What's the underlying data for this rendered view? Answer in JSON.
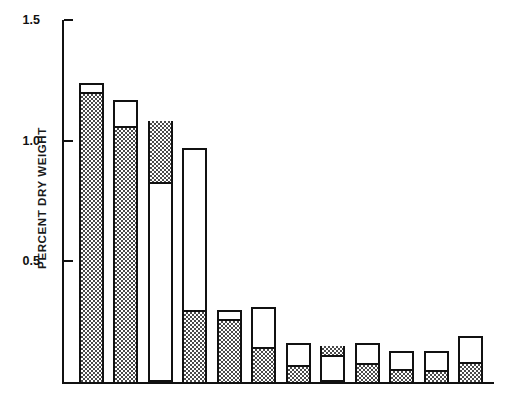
{
  "chart_data": {
    "type": "bar",
    "title": "",
    "subtitle": "",
    "xlabel": "",
    "ylabel": "PERCENT DRY WEIGHT",
    "ylim": [
      0,
      1.5
    ],
    "yticks": [
      0.5,
      1.0,
      1.5
    ],
    "ytick_labels": [
      "0.5",
      "1.0",
      "1.5"
    ],
    "grid": false,
    "legend": null,
    "stacked": true,
    "categories": [
      "N",
      "Ca",
      "K",
      "Si",
      "Mg",
      "S",
      "Al",
      "P",
      "Cl",
      "Fe",
      "Mn",
      "Na"
    ],
    "values": [
      1.24,
      1.17,
      1.08,
      0.97,
      0.3,
      0.31,
      0.16,
      0.15,
      0.16,
      0.13,
      0.13,
      0.19
    ],
    "series": [
      {
        "name": "shaded",
        "fill": "stipple",
        "values": [
          1.2,
          1.06,
          0.26,
          0.3,
          0.26,
          0.145,
          0.07,
          0.045,
          0.08,
          0.055,
          0.05,
          0.085
        ]
      },
      {
        "name": "open",
        "fill": "white",
        "values": [
          0.04,
          0.11,
          0.82,
          0.67,
          0.04,
          0.165,
          0.09,
          0.105,
          0.08,
          0.075,
          0.08,
          0.105
        ]
      }
    ],
    "bars": [
      {
        "category": "N",
        "total": 1.24,
        "shaded_from": 0.0,
        "shaded_to": 1.2
      },
      {
        "category": "Ca",
        "total": 1.17,
        "shaded_from": 0.0,
        "shaded_to": 1.06
      },
      {
        "category": "K",
        "total": 1.08,
        "shaded_from": 0.82,
        "shaded_to": 1.08
      },
      {
        "category": "Si",
        "total": 0.97,
        "shaded_from": 0.0,
        "shaded_to": 0.3
      },
      {
        "category": "Mg",
        "total": 0.3,
        "shaded_from": 0.0,
        "shaded_to": 0.26
      },
      {
        "category": "S",
        "total": 0.31,
        "shaded_from": 0.0,
        "shaded_to": 0.145
      },
      {
        "category": "Al",
        "total": 0.16,
        "shaded_from": 0.0,
        "shaded_to": 0.07
      },
      {
        "category": "P",
        "total": 0.15,
        "shaded_from": 0.105,
        "shaded_to": 0.15
      },
      {
        "category": "Cl",
        "total": 0.16,
        "shaded_from": 0.0,
        "shaded_to": 0.08
      },
      {
        "category": "Fe",
        "total": 0.13,
        "shaded_from": 0.0,
        "shaded_to": 0.055
      },
      {
        "category": "Mn",
        "total": 0.13,
        "shaded_from": 0.0,
        "shaded_to": 0.05
      },
      {
        "category": "Na",
        "total": 0.19,
        "shaded_from": 0.0,
        "shaded_to": 0.085
      }
    ],
    "colors": {
      "axis": "#111111",
      "bar_outline": "#111111",
      "bar_open_fill": "#ffffff",
      "bar_shaded_fill": "#4a4a4a",
      "background": "#ffffff"
    }
  }
}
